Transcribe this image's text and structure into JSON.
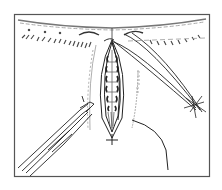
{
  "figure": {
    "type": "surgical-line-illustration",
    "colors": {
      "line": "#2a2a2a",
      "frame": "#555555",
      "hatch": "#9a9a9a",
      "background": "#ffffff"
    },
    "elements": [
      "frame",
      "skin-edge",
      "hair-stubble",
      "wound-incision",
      "suture-loops",
      "needle-holder",
      "suture-thread",
      "skin-fold-line"
    ]
  }
}
